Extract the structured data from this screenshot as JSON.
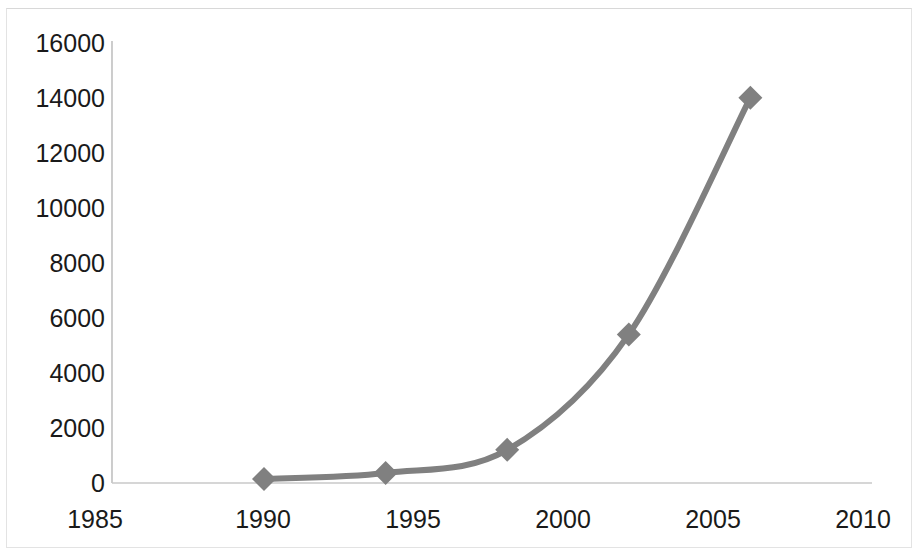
{
  "chart_data": {
    "type": "line",
    "title": "",
    "subtitle": "",
    "xlabel": "",
    "ylabel": "",
    "x": [
      1990,
      1994,
      1998,
      2002,
      2006
    ],
    "values": [
      145,
      360,
      1200,
      5380,
      13950
    ],
    "series": [
      {
        "name": "",
        "x": [
          1990,
          1994,
          1998,
          2002,
          2006
        ],
        "values": [
          145,
          360,
          1200,
          5380,
          13950
        ]
      }
    ],
    "xlim": [
      1985,
      2010
    ],
    "ylim": [
      0,
      16000
    ],
    "x_ticks": [
      1985,
      1990,
      1995,
      2000,
      2005,
      2010
    ],
    "y_ticks": [
      0,
      2000,
      4000,
      6000,
      8000,
      10000,
      12000,
      14000,
      16000
    ],
    "x_tick_labels": [
      "1985",
      "1990",
      "1995",
      "2000",
      "2005",
      "2010"
    ],
    "y_tick_labels": [
      "0",
      "2000",
      "4000",
      "6000",
      "8000",
      "10000",
      "12000",
      "14000",
      "16000"
    ],
    "grid": false,
    "legend": false,
    "legend_position": "none",
    "marker": "diamond",
    "smooth": true,
    "colors": {
      "line": "#808080",
      "marker": "#808080",
      "axis": "#bfbfbf",
      "tick_text": "#1a1a1a",
      "background": "#ffffff"
    }
  }
}
